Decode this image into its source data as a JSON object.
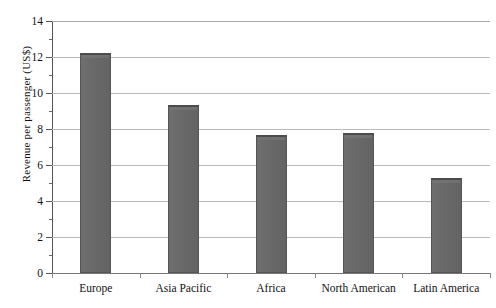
{
  "chart_data": {
    "type": "bar",
    "title": "",
    "xlabel": "",
    "ylabel": "Revenue per passenger (US$)",
    "categories": [
      "Europe",
      "Asia Pacific",
      "Africa",
      "North American",
      "Latin America"
    ],
    "values": [
      12.25,
      9.35,
      7.65,
      7.8,
      5.3
    ],
    "ylim": [
      0,
      14
    ],
    "ytick_labels": [
      "0",
      "2",
      "4",
      "6",
      "8",
      "10",
      "12",
      "14"
    ],
    "ytick_values": [
      0,
      2,
      4,
      6,
      8,
      10,
      12,
      14
    ],
    "yminor_values": [
      1,
      3,
      5,
      7,
      9,
      11,
      13
    ],
    "grid": true,
    "legend": false,
    "bar_color": "#686868",
    "bar_edge_color": "#555555",
    "gridline_color": "#b9b9b9",
    "axis_color": "#555555",
    "background": "#ffffff"
  }
}
